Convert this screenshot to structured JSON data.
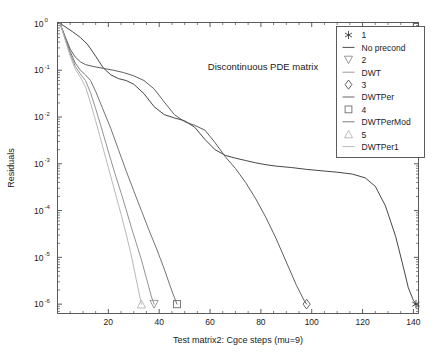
{
  "chart_data": {
    "type": "line",
    "title": "Discontinuous PDE matrix",
    "xlabel": "Test matrix2: Cgce steps (mu=9)",
    "ylabel": "Residuals",
    "xlim": [
      0,
      142
    ],
    "ylim_log": [
      -6.2,
      0.02
    ],
    "yscale": "log",
    "grid": false,
    "legend_position": "upper-right-inside",
    "xticks": [
      20,
      40,
      60,
      80,
      100,
      120,
      140
    ],
    "xtick_labels": [
      "20",
      "40",
      "60",
      "80",
      "100",
      "120",
      "140"
    ],
    "yticks_exponents": [
      0,
      -1,
      -2,
      -3,
      -4,
      -5,
      -6
    ],
    "ytick_labels": [
      "10",
      "10",
      "10",
      "10",
      "10",
      "10",
      "10"
    ],
    "ytick_exponents_text": [
      "0",
      "-1",
      "-2",
      "-3",
      "-4",
      "-5",
      "-6"
    ],
    "legend_entries": [
      {
        "marker": "asterisk-marker",
        "number": "1",
        "label": "No precond",
        "color": "#3c3c3c"
      },
      {
        "marker": "down-triangle-marker",
        "number": "2",
        "label": "DWT",
        "color": "#8c8c8c"
      },
      {
        "marker": "diamond-marker",
        "number": "3",
        "label": "DWTPer",
        "color": "#555555"
      },
      {
        "marker": "square-marker",
        "number": "4",
        "label": "DWTPerMod",
        "color": "#6e6e6e"
      },
      {
        "marker": "up-triangle-marker",
        "number": "5",
        "label": "DWTPer1",
        "color": "#b4b4b4"
      }
    ],
    "series": [
      {
        "name": "No precond",
        "number": "1",
        "marker": "asterisk-marker",
        "color": "#3c3c3c",
        "end_marker_x": 141,
        "end_marker_y_exp": -6.0,
        "points": [
          [
            1,
            0.0
          ],
          [
            3,
            -0.07
          ],
          [
            6,
            -0.18
          ],
          [
            9,
            -0.3
          ],
          [
            12,
            -0.46
          ],
          [
            15,
            -0.7
          ],
          [
            18,
            -0.95
          ],
          [
            21,
            -1.1
          ],
          [
            24,
            -1.18
          ],
          [
            27,
            -1.22
          ],
          [
            30,
            -1.3
          ],
          [
            34,
            -1.5
          ],
          [
            38,
            -1.78
          ],
          [
            42,
            -1.95
          ],
          [
            46,
            -2.02
          ],
          [
            50,
            -2.08
          ],
          [
            54,
            -2.22
          ],
          [
            58,
            -2.48
          ],
          [
            62,
            -2.7
          ],
          [
            66,
            -2.82
          ],
          [
            70,
            -2.88
          ],
          [
            74,
            -2.93
          ],
          [
            78,
            -2.98
          ],
          [
            82,
            -3.02
          ],
          [
            86,
            -3.05
          ],
          [
            92,
            -3.08
          ],
          [
            98,
            -3.12
          ],
          [
            104,
            -3.15
          ],
          [
            110,
            -3.18
          ],
          [
            116,
            -3.22
          ],
          [
            121,
            -3.3
          ],
          [
            125,
            -3.48
          ],
          [
            129,
            -3.9
          ],
          [
            133,
            -4.55
          ],
          [
            136,
            -5.2
          ],
          [
            138,
            -5.65
          ],
          [
            140,
            -5.92
          ],
          [
            141,
            -6.0
          ]
        ]
      },
      {
        "name": "DWTPer",
        "number": "3",
        "marker": "diamond-marker",
        "color": "#555555",
        "end_marker_x": 98,
        "end_marker_y_exp": -6.0,
        "points": [
          [
            1,
            0.0
          ],
          [
            3,
            -0.28
          ],
          [
            5,
            -0.55
          ],
          [
            7,
            -0.72
          ],
          [
            9,
            -0.82
          ],
          [
            11,
            -0.88
          ],
          [
            14,
            -0.92
          ],
          [
            18,
            -0.96
          ],
          [
            22,
            -1.0
          ],
          [
            26,
            -1.05
          ],
          [
            30,
            -1.12
          ],
          [
            34,
            -1.22
          ],
          [
            38,
            -1.4
          ],
          [
            42,
            -1.68
          ],
          [
            46,
            -1.95
          ],
          [
            50,
            -2.1
          ],
          [
            54,
            -2.18
          ],
          [
            58,
            -2.28
          ],
          [
            62,
            -2.55
          ],
          [
            66,
            -2.85
          ],
          [
            70,
            -3.1
          ],
          [
            74,
            -3.4
          ],
          [
            78,
            -3.75
          ],
          [
            82,
            -4.15
          ],
          [
            86,
            -4.6
          ],
          [
            90,
            -5.1
          ],
          [
            94,
            -5.6
          ],
          [
            97,
            -5.92
          ],
          [
            98,
            -6.0
          ]
        ]
      },
      {
        "name": "DWTPerMod",
        "number": "4",
        "marker": "square-marker",
        "color": "#6e6e6e",
        "end_marker_x": 47,
        "end_marker_y_exp": -6.0,
        "points": [
          [
            1,
            0.0
          ],
          [
            3,
            -0.3
          ],
          [
            5,
            -0.6
          ],
          [
            7,
            -0.85
          ],
          [
            9,
            -1.0
          ],
          [
            11,
            -1.1
          ],
          [
            13,
            -1.22
          ],
          [
            15,
            -1.45
          ],
          [
            18,
            -1.85
          ],
          [
            21,
            -2.25
          ],
          [
            24,
            -2.7
          ],
          [
            27,
            -3.15
          ],
          [
            30,
            -3.58
          ],
          [
            33,
            -4.0
          ],
          [
            36,
            -4.42
          ],
          [
            39,
            -4.82
          ],
          [
            42,
            -5.25
          ],
          [
            45,
            -5.72
          ],
          [
            47,
            -6.0
          ]
        ]
      },
      {
        "name": "DWT",
        "number": "2",
        "marker": "down-triangle-marker",
        "color": "#8c8c8c",
        "end_marker_x": 38,
        "end_marker_y_exp": -6.0,
        "points": [
          [
            1,
            0.0
          ],
          [
            3,
            -0.32
          ],
          [
            5,
            -0.65
          ],
          [
            7,
            -0.92
          ],
          [
            9,
            -1.08
          ],
          [
            11,
            -1.22
          ],
          [
            13,
            -1.48
          ],
          [
            15,
            -1.82
          ],
          [
            17,
            -2.18
          ],
          [
            19,
            -2.55
          ],
          [
            21,
            -2.92
          ],
          [
            23,
            -3.28
          ],
          [
            25,
            -3.62
          ],
          [
            27,
            -3.98
          ],
          [
            29,
            -4.35
          ],
          [
            31,
            -4.7
          ],
          [
            33,
            -5.05
          ],
          [
            35,
            -5.45
          ],
          [
            37,
            -5.85
          ],
          [
            38,
            -6.0
          ]
        ]
      },
      {
        "name": "DWTPer1",
        "number": "5",
        "marker": "up-triangle-marker",
        "color": "#b4b4b4",
        "end_marker_x": 33,
        "end_marker_y_exp": -6.0,
        "points": [
          [
            1,
            0.0
          ],
          [
            3,
            -0.35
          ],
          [
            5,
            -0.7
          ],
          [
            7,
            -0.98
          ],
          [
            9,
            -1.15
          ],
          [
            11,
            -1.35
          ],
          [
            13,
            -1.7
          ],
          [
            15,
            -2.08
          ],
          [
            17,
            -2.48
          ],
          [
            19,
            -2.88
          ],
          [
            21,
            -3.28
          ],
          [
            23,
            -3.68
          ],
          [
            25,
            -4.08
          ],
          [
            27,
            -4.5
          ],
          [
            29,
            -4.95
          ],
          [
            31,
            -5.48
          ],
          [
            33,
            -6.0
          ]
        ]
      }
    ]
  }
}
